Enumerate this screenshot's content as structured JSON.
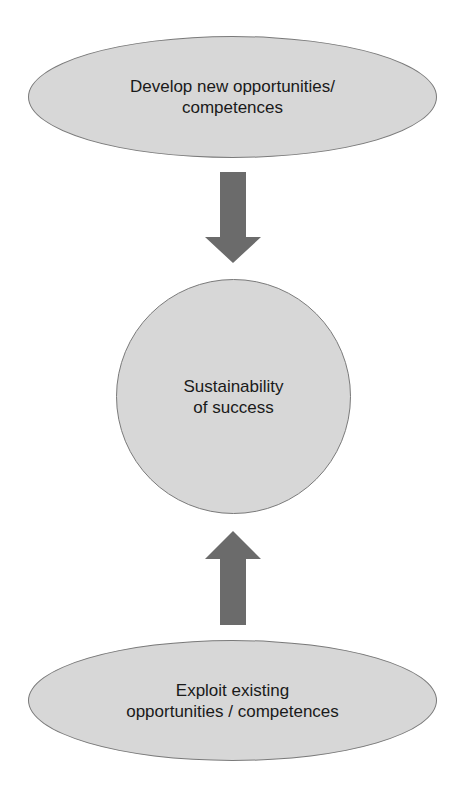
{
  "diagram": {
    "top_node": {
      "lines": [
        "Develop new opportunities/",
        "competences"
      ]
    },
    "center_node": {
      "lines": [
        "Sustainability",
        "of success"
      ]
    },
    "bottom_node": {
      "lines": [
        "Exploit existing",
        "opportunities / competences"
      ]
    },
    "arrows": [
      {
        "from": "top_node",
        "to": "center_node",
        "direction": "down"
      },
      {
        "from": "bottom_node",
        "to": "center_node",
        "direction": "up"
      }
    ],
    "colors": {
      "node_fill": "#d7d7d7",
      "node_border": "#7a7a7a",
      "arrow_fill": "#6b6b6b",
      "text": "#1a1a1a"
    }
  }
}
